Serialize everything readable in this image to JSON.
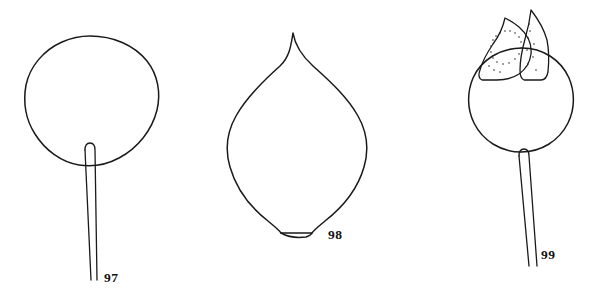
{
  "plate": {
    "background_color": "#ffffff",
    "ink_color": "#1a1a1a",
    "width": 604,
    "height": 295,
    "style": "black-and-white botanical line drawing"
  },
  "figures": [
    {
      "number": "97",
      "label": "97",
      "subject": "orbicular leaf blade with long petiole",
      "parts": [
        "blade",
        "petiole"
      ]
    },
    {
      "number": "98",
      "label": "98",
      "subject": "ovate leaf blade with acuminate apex and truncate base",
      "parts": [
        "blade",
        "apex",
        "base"
      ]
    },
    {
      "number": "99",
      "label": "99",
      "subject": "globose fruit capped by two pointed stippled bracts on a stalk",
      "parts": [
        "fruit",
        "bract-left",
        "bract-right",
        "stalk"
      ]
    }
  ],
  "icons": {
    "fig97": "round-leaf-icon",
    "fig98": "ovate-leaf-icon",
    "fig99": "bracted-fruit-icon"
  }
}
